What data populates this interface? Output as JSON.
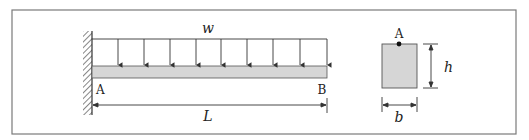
{
  "diagram": {
    "type": "cantilever-beam",
    "load": {
      "label": "w",
      "kind": "uniformly-distributed",
      "arrow_count": 9
    },
    "beam": {
      "left_end_label": "A",
      "right_end_label": "B",
      "length_label": "L",
      "support": "fixed-wall"
    },
    "cross_section": {
      "point_label": "A",
      "height_label": "h",
      "width_label": "b",
      "shape": "rectangle"
    },
    "colors": {
      "frame": "#7a7a7a",
      "beam_fill": "#d6d6d6",
      "line": "#333333"
    }
  }
}
